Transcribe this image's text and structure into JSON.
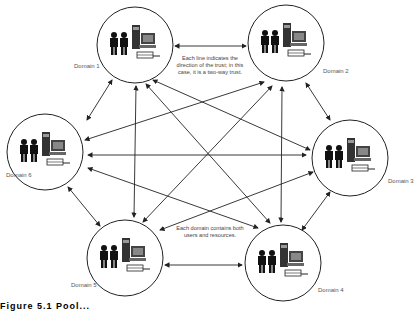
{
  "diagram": {
    "domains": [
      {
        "id": 1,
        "label": "Domain 1",
        "cx": 135,
        "cy": 45
      },
      {
        "id": 2,
        "label": "Domain 2",
        "cx": 286,
        "cy": 43
      },
      {
        "id": 3,
        "label": "Domain 3",
        "cx": 350,
        "cy": 158
      },
      {
        "id": 4,
        "label": "Domain 4",
        "cx": 283,
        "cy": 263
      },
      {
        "id": 5,
        "label": "Domain 5",
        "cx": 125,
        "cy": 258
      },
      {
        "id": 6,
        "label": "Domain 6",
        "cx": 45,
        "cy": 152
      }
    ],
    "annotations": {
      "trust_note": "Each line indicates the direction of the trust; in this case, it is a two-way trust.",
      "resources_note": "Each domain contains both users and resources."
    },
    "caption": "Figure 5.1  Pool..."
  }
}
